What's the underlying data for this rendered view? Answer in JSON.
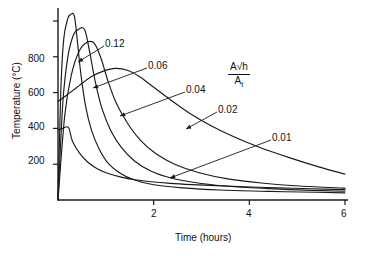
{
  "chart_data": {
    "type": "line",
    "title": "",
    "xlabel": "Time (hours)",
    "ylabel": "Temperature (°C)",
    "xlim": [
      0,
      6
    ],
    "ylim": [
      0,
      1050
    ],
    "xticks": [
      2,
      4,
      6
    ],
    "xtick_labels": [
      "2",
      "4",
      "6"
    ],
    "yticks": [
      200,
      400,
      600,
      800,
      1000
    ],
    "ytick_labels": [
      "200",
      "400",
      "600",
      "800",
      ""
    ],
    "grid": false,
    "legend": "inline-annotations",
    "legend_title_parts": {
      "numerator": "A√h",
      "denominator": "A",
      "denominator_sub": "t"
    },
    "legend_title_plain": "A√h / A_t",
    "series": [
      {
        "name": "0.12",
        "label": "0.12",
        "points": [
          [
            0.0,
            0
          ],
          [
            0.06,
            620
          ],
          [
            0.12,
            900
          ],
          [
            0.2,
            1010
          ],
          [
            0.26,
            1035
          ],
          [
            0.34,
            1030
          ],
          [
            0.4,
            900
          ],
          [
            0.48,
            700
          ],
          [
            0.58,
            520
          ],
          [
            0.7,
            390
          ],
          [
            0.86,
            285
          ],
          [
            1.05,
            205
          ],
          [
            1.3,
            150
          ],
          [
            1.6,
            112
          ],
          [
            2.0,
            85
          ],
          [
            2.6,
            68
          ],
          [
            3.4,
            56
          ],
          [
            4.4,
            48
          ],
          [
            5.4,
            43
          ],
          [
            6.0,
            40
          ]
        ]
      },
      {
        "name": "0.06",
        "label": "0.06",
        "points": [
          [
            0.0,
            0
          ],
          [
            0.1,
            540
          ],
          [
            0.2,
            790
          ],
          [
            0.32,
            920
          ],
          [
            0.44,
            955
          ],
          [
            0.56,
            950
          ],
          [
            0.66,
            830
          ],
          [
            0.78,
            660
          ],
          [
            0.92,
            510
          ],
          [
            1.1,
            390
          ],
          [
            1.32,
            295
          ],
          [
            1.6,
            218
          ],
          [
            1.95,
            160
          ],
          [
            2.4,
            120
          ],
          [
            3.0,
            92
          ],
          [
            3.7,
            74
          ],
          [
            4.5,
            62
          ],
          [
            5.3,
            54
          ],
          [
            6.0,
            49
          ]
        ]
      },
      {
        "name": "0.04",
        "label": "0.04",
        "points": [
          [
            0.0,
            0
          ],
          [
            0.14,
            470
          ],
          [
            0.28,
            700
          ],
          [
            0.44,
            830
          ],
          [
            0.6,
            880
          ],
          [
            0.76,
            875
          ],
          [
            0.9,
            790
          ],
          [
            1.05,
            660
          ],
          [
            1.22,
            540
          ],
          [
            1.45,
            430
          ],
          [
            1.72,
            335
          ],
          [
            2.05,
            258
          ],
          [
            2.45,
            198
          ],
          [
            2.95,
            152
          ],
          [
            3.55,
            118
          ],
          [
            4.25,
            95
          ],
          [
            5.05,
            78
          ],
          [
            6.0,
            66
          ]
        ]
      },
      {
        "name": "0.02",
        "label": "0.02",
        "points": [
          [
            0.0,
            550
          ],
          [
            0.2,
            590
          ],
          [
            0.45,
            640
          ],
          [
            0.7,
            690
          ],
          [
            0.95,
            720
          ],
          [
            1.2,
            735
          ],
          [
            1.45,
            725
          ],
          [
            1.7,
            690
          ],
          [
            2.0,
            630
          ],
          [
            2.35,
            560
          ],
          [
            2.75,
            485
          ],
          [
            3.2,
            415
          ],
          [
            3.7,
            350
          ],
          [
            4.25,
            290
          ],
          [
            4.85,
            235
          ],
          [
            5.45,
            185
          ],
          [
            6.0,
            145
          ]
        ]
      },
      {
        "name": "0.01",
        "label": "0.01",
        "points": [
          [
            0.0,
            390
          ],
          [
            0.1,
            400
          ],
          [
            0.22,
            405
          ],
          [
            0.3,
            330
          ],
          [
            0.45,
            262
          ],
          [
            0.62,
            212
          ],
          [
            0.82,
            175
          ],
          [
            1.05,
            148
          ],
          [
            1.32,
            128
          ],
          [
            1.62,
            113
          ],
          [
            1.95,
            102
          ],
          [
            2.35,
            93
          ],
          [
            2.8,
            86
          ],
          [
            3.3,
            80
          ],
          [
            3.9,
            74
          ],
          [
            4.6,
            68
          ],
          [
            5.3,
            63
          ],
          [
            6.0,
            58
          ]
        ]
      }
    ],
    "annotations": [
      {
        "label": "0.12",
        "text_x": 105,
        "text_y": 38,
        "leader_from": [
          104,
          46
        ],
        "leader_to": [
          78,
          62
        ]
      },
      {
        "label": "0.06",
        "text_x": 148,
        "text_y": 60,
        "leader_from": [
          147,
          68
        ],
        "leader_to": [
          93,
          88
        ]
      },
      {
        "label": "0.04",
        "text_x": 186,
        "text_y": 84,
        "leader_from": [
          185,
          92
        ],
        "leader_to": [
          120,
          116
        ]
      },
      {
        "label": "0.02",
        "text_x": 218,
        "text_y": 104,
        "leader_from": [
          217,
          112
        ],
        "leader_to": [
          186,
          129
        ]
      },
      {
        "label": "0.01",
        "text_x": 272,
        "text_y": 132,
        "leader_from": [
          271,
          140
        ],
        "leader_to": [
          170,
          178
        ]
      }
    ]
  },
  "axes": {
    "x_title": "Time (hours)",
    "y_title": "Temperature (°C)",
    "x_tick_labels": [
      "2",
      "4",
      "6"
    ],
    "y_tick_labels": [
      "800",
      "600",
      "400",
      "200"
    ]
  },
  "colors": {
    "axis": "#1a1a1a",
    "curve": "#1a1a1a",
    "text": "#111111",
    "background": "#ffffff"
  }
}
